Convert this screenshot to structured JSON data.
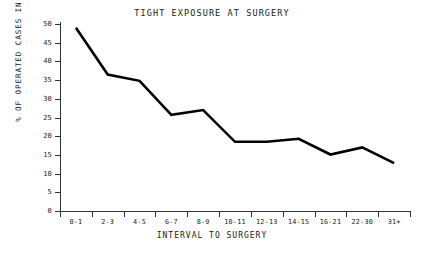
{
  "chart_data": {
    "type": "line",
    "title": "TIGHT EXPOSURE AT SURGERY",
    "xlabel": "INTERVAL TO SURGERY",
    "ylabel": "% OF OPERATED CASES IN INTERVAL",
    "categories": [
      "0-1",
      "2-3",
      "4-5",
      "6-7",
      "8-9",
      "10-11",
      "12-13",
      "14-15",
      "16-21",
      "22-30",
      "31+"
    ],
    "values": [
      49,
      36.5,
      34.8,
      25.7,
      27,
      18.5,
      18.5,
      19.3,
      15.1,
      17,
      12.8
    ],
    "ylim": [
      0,
      50
    ],
    "ytick_labels": [
      "0",
      "5",
      "10",
      "15",
      "20",
      "25",
      "30",
      "35",
      "40",
      "45",
      "50"
    ],
    "ytick_values": [
      0,
      5,
      10,
      15,
      20,
      25,
      30,
      35,
      40,
      45,
      50
    ],
    "grid": false,
    "legend": false,
    "line_color": "#000000",
    "axis_color": "#333333",
    "background": "#ffffff"
  }
}
